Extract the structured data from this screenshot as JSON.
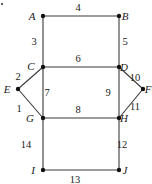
{
  "diagram": {
    "type": "graph",
    "nodes": [
      {
        "id": "A",
        "label": "A",
        "x": 43,
        "y": 16,
        "lx": 32,
        "ly": 20
      },
      {
        "id": "B",
        "label": "B",
        "x": 119,
        "y": 16,
        "lx": 125,
        "ly": 20
      },
      {
        "id": "C",
        "label": "C",
        "x": 43,
        "y": 67,
        "lx": 31,
        "ly": 70
      },
      {
        "id": "D",
        "label": "D",
        "x": 119,
        "y": 67,
        "lx": 124,
        "ly": 71
      },
      {
        "id": "E",
        "label": "E",
        "x": 18,
        "y": 89,
        "lx": 7,
        "ly": 93
      },
      {
        "id": "F",
        "label": "F",
        "x": 143,
        "y": 89,
        "lx": 148,
        "ly": 93
      },
      {
        "id": "G",
        "label": "G",
        "x": 43,
        "y": 118,
        "lx": 30,
        "ly": 122
      },
      {
        "id": "H",
        "label": "H",
        "x": 119,
        "y": 118,
        "lx": 124,
        "ly": 122
      },
      {
        "id": "I",
        "label": "I",
        "x": 43,
        "y": 170,
        "lx": 33,
        "ly": 174
      },
      {
        "id": "J",
        "label": "J",
        "x": 119,
        "y": 170,
        "lx": 125,
        "ly": 174
      }
    ],
    "edges": [
      {
        "from": "A",
        "to": "B",
        "label": "4",
        "lx": 78,
        "ly": 11
      },
      {
        "from": "A",
        "to": "C",
        "label": "3",
        "lx": 34,
        "ly": 45
      },
      {
        "from": "B",
        "to": "D",
        "label": "5",
        "lx": 125,
        "ly": 45
      },
      {
        "from": "C",
        "to": "D",
        "label": "6",
        "lx": 78,
        "ly": 62
      },
      {
        "from": "C",
        "to": "E",
        "label": "2",
        "lx": 18,
        "ly": 80
      },
      {
        "from": "C",
        "to": "G",
        "label": "7",
        "lx": 47,
        "ly": 96
      },
      {
        "from": "D",
        "to": "H",
        "label": "9",
        "lx": 108,
        "ly": 96
      },
      {
        "from": "D",
        "to": "F",
        "label": "10",
        "lx": 135,
        "ly": 81
      },
      {
        "from": "E",
        "to": "G",
        "label": "1",
        "lx": 19,
        "ly": 112
      },
      {
        "from": "F",
        "to": "H",
        "label": "11",
        "lx": 135,
        "ly": 110
      },
      {
        "from": "G",
        "to": "H",
        "label": "8",
        "lx": 78,
        "ly": 113
      },
      {
        "from": "G",
        "to": "I",
        "label": "14",
        "lx": 26,
        "ly": 148
      },
      {
        "from": "H",
        "to": "J",
        "label": "12",
        "lx": 122,
        "ly": 148
      },
      {
        "from": "I",
        "to": "J",
        "label": "13",
        "lx": 75,
        "ly": 183
      }
    ],
    "stray_mark": {
      "x": 2,
      "y": 4
    }
  }
}
